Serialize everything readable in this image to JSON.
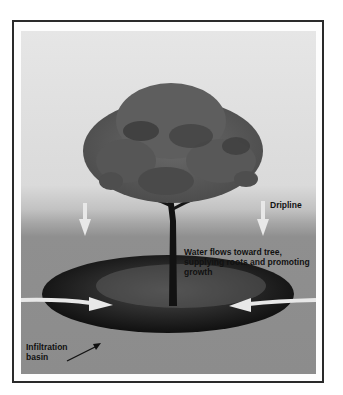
{
  "diagram": {
    "labels": {
      "dripline": "Dripline",
      "water_flow": "Water flows toward tree, supplying roots and promoting growth",
      "water_flow_line1": "Water flows toward tree,",
      "water_flow_line2": "supplying roots and promoting",
      "water_flow_line3": "growth",
      "infiltration_line1": "Infiltration",
      "infiltration_line2": "basin"
    },
    "colors": {
      "frame_border": "#2a2a2a",
      "sky": "#e0e0e0",
      "ground": "#8c8c8c",
      "basin": "#1a1a1a",
      "canopy": "#5a5a5a",
      "arrow_fill": "#e8e8e8"
    }
  }
}
